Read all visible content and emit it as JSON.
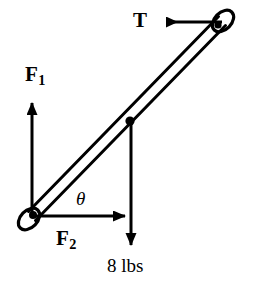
{
  "figure": {
    "kind": "free-body-diagram",
    "background_color": "#ffffff",
    "stroke_color": "#000000",
    "width": 253,
    "height": 289
  },
  "labels": {
    "tension": "T",
    "force_1": "F",
    "force_1_subscript": "1",
    "force_2": "F",
    "force_2_subscript": "2",
    "angle": "θ",
    "weight": "8 lbs"
  },
  "geometry": {
    "rod": {
      "pivot_x": 32,
      "pivot_y": 216,
      "tip_x": 222,
      "tip_y": 21,
      "thickness": 9,
      "angle_degrees": 46
    },
    "midpoint": {
      "x": 130,
      "y": 121
    },
    "eyelet_radius": 8
  },
  "vectors": [
    {
      "name": "tension",
      "label": "T",
      "direction": "left",
      "from_x": 222,
      "from_y": 22,
      "to_x": 163,
      "to_y": 22
    },
    {
      "name": "force-1",
      "label": "F1",
      "direction": "up",
      "from_x": 32,
      "from_y": 216,
      "to_x": 32,
      "to_y": 99
    },
    {
      "name": "force-2",
      "label": "F2",
      "direction": "right",
      "from_x": 32,
      "from_y": 216,
      "to_x": 129,
      "to_y": 216
    },
    {
      "name": "weight",
      "label": "8 lbs",
      "direction": "down",
      "from_x": 131,
      "from_y": 122,
      "to_x": 131,
      "to_y": 249
    }
  ]
}
